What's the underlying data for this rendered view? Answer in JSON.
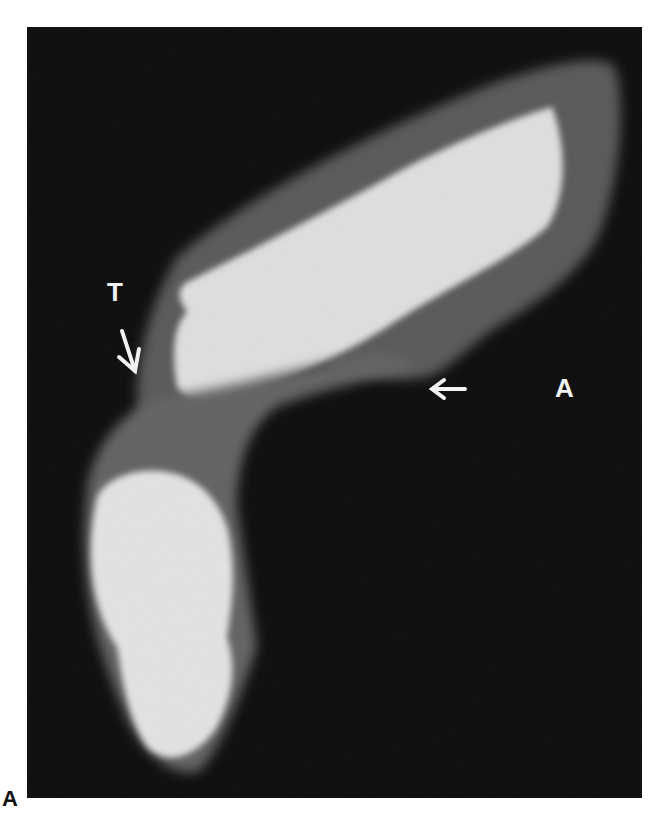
{
  "figure": {
    "panel_label": "A",
    "image_type": "radiograph",
    "annotations": [
      {
        "label": "T",
        "arrow_direction": "down-right"
      },
      {
        "label": "A",
        "arrow_direction": "left"
      }
    ],
    "colors": {
      "background": "#0e0e0e",
      "bone_bright": "#e6e6e6",
      "soft_tissue": "#6e6e6e",
      "label": "#f2f2f2",
      "page": "#ffffff"
    }
  }
}
